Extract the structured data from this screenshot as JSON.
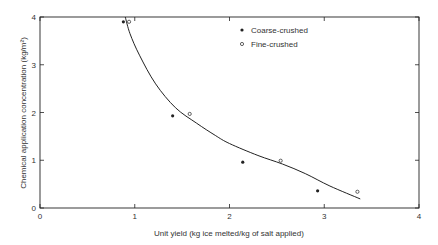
{
  "chart_data": {
    "type": "scatter",
    "title": "",
    "xlabel": "Unit yield (kg ice melted/kg of salt applied)",
    "ylabel": "Chemical application concentration (kg/m²)",
    "xlim": [
      0,
      4
    ],
    "ylim": [
      0,
      4
    ],
    "xticks": [
      "0",
      "1",
      "2",
      "3",
      "4"
    ],
    "yticks": [
      "0",
      "1",
      "2",
      "3",
      "4"
    ],
    "grid": false,
    "legend_position": "upper right (inside)",
    "series": [
      {
        "name": "Coarse-crushed",
        "marker": "filled-circle",
        "x": [
          0.88,
          1.4,
          2.14,
          2.93
        ],
        "y": [
          3.9,
          1.93,
          0.96,
          0.36
        ]
      },
      {
        "name": "Fine-crushed",
        "marker": "open-circle",
        "x": [
          0.94,
          1.58,
          2.54,
          3.35
        ],
        "y": [
          3.9,
          1.97,
          0.99,
          0.34
        ]
      },
      {
        "name": "Fitted curve",
        "marker": "line",
        "x": [
          0.9,
          0.95,
          1.05,
          1.22,
          1.43,
          1.65,
          1.85,
          2.0,
          2.3,
          2.56,
          2.8,
          3.06,
          3.38
        ],
        "y": [
          4.0,
          3.65,
          3.2,
          2.6,
          2.1,
          1.78,
          1.52,
          1.35,
          1.1,
          0.92,
          0.72,
          0.46,
          0.19
        ]
      }
    ]
  },
  "legend": {
    "items": [
      {
        "label": "Coarse-crushed",
        "marker": "filled-circle"
      },
      {
        "label": "Fine-crushed",
        "marker": "open-circle"
      }
    ]
  },
  "axes": {
    "x_title": "Unit yield (kg ice melted/kg of salt applied)",
    "y_title": "Chemical application concentration (kg/m²)"
  },
  "colors": {
    "ink": "#222222",
    "background": "#ffffff"
  }
}
